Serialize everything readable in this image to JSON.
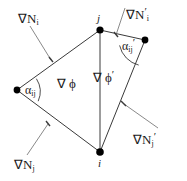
{
  "figure": {
    "name": "gradient-quadrilateral-diagram",
    "background_color": "#ffffff",
    "line_color": "#3a3a3a",
    "node_color": "#000000",
    "width": 187,
    "height": 181
  },
  "nodes": [
    {
      "id": "left",
      "label": "",
      "x": 17,
      "y": 90,
      "label_dx": 0,
      "label_dy": 0
    },
    {
      "id": "j",
      "label": "j",
      "x": 100,
      "y": 30,
      "label_dx": -3,
      "label_dy": -15
    },
    {
      "id": "right",
      "label": "",
      "x": 145,
      "y": 40,
      "label_dx": 0,
      "label_dy": 0
    },
    {
      "id": "i",
      "label": "i",
      "x": 100,
      "y": 152,
      "label_dx": -2,
      "label_dy": 8
    }
  ],
  "edges": [
    {
      "from": "left",
      "to": "j"
    },
    {
      "from": "left",
      "to": "i"
    },
    {
      "from": "j",
      "to": "i"
    },
    {
      "from": "j",
      "to": "right"
    },
    {
      "from": "right",
      "to": "i"
    }
  ],
  "gradient_labels": [
    {
      "id": "grad-N-i",
      "nabla": "∇",
      "base": "N",
      "subscript": "i",
      "prime": "",
      "text": "∇N_i",
      "x": 18,
      "y": 12,
      "leader": {
        "x1": 30,
        "y1": 26,
        "x2": 51,
        "y2": 60
      }
    },
    {
      "id": "grad-N-i-prime",
      "nabla": "∇",
      "base": "N",
      "subscript": "i",
      "prime": "′",
      "text": "∇N'_i",
      "x": 126,
      "y": 6,
      "leader": {
        "x1": 125,
        "y1": 8,
        "x2": 116,
        "y2": 35
      }
    },
    {
      "id": "grad-N-j",
      "nabla": "∇",
      "base": "N",
      "subscript": "j",
      "prime": "",
      "text": "∇N_j",
      "x": 14,
      "y": 158,
      "leader": {
        "x1": 27,
        "y1": 155,
        "x2": 48,
        "y2": 124
      }
    },
    {
      "id": "grad-N-j-prime",
      "nabla": "∇",
      "base": "N",
      "subscript": "j",
      "prime": "′",
      "text": "∇N'_j",
      "x": 133,
      "y": 131,
      "leader": {
        "x1": 158,
        "y1": 128,
        "x2": 124,
        "y2": 104
      }
    }
  ],
  "field_labels": [
    {
      "id": "grad-phi",
      "nabla": "∇",
      "symbol": "ϕ",
      "prime": "",
      "text": "∇ ϕ",
      "x": 57,
      "y": 77
    },
    {
      "id": "grad-phi-prime",
      "nabla": "∇",
      "symbol": "ϕ",
      "prime": "′",
      "text": "∇ ϕ'",
      "x": 93,
      "y": 69
    }
  ],
  "angle_labels": [
    {
      "id": "alpha-ij",
      "symbol": "α",
      "subscript": "ij",
      "prime": "",
      "text": "α_ij",
      "x": 25,
      "y": 84,
      "arc": {
        "vertex_x": 17,
        "vertex_y": 90,
        "radius": 24,
        "start_deg": -36,
        "end_deg": 28
      }
    },
    {
      "id": "alpha-ij-prime",
      "symbol": "α",
      "subscript": "ij",
      "prime": "′",
      "text": "α'_ij",
      "x": 122,
      "y": 37,
      "arc": {
        "vertex_x": 145,
        "vertex_y": 40,
        "radius": 26,
        "start_deg": 168,
        "end_deg": 256
      }
    }
  ]
}
